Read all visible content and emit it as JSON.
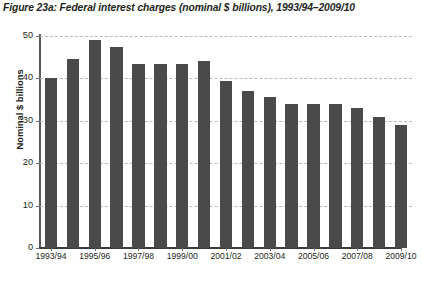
{
  "figure": {
    "title": "Figure 23a: Federal interest charges (nominal $ billions), 1993/94–2009/10",
    "bar_color": "#4a4a4a",
    "gridline_color": "#b9b9bb",
    "axis_color": "#58595b",
    "text_color": "#231f20",
    "background": "#ffffff"
  },
  "chart_data": {
    "type": "bar",
    "title": "Figure 23a: Federal interest charges (nominal $ billions), 1993/94–2009/10",
    "xlabel": "",
    "ylabel": "Nominal $ billions",
    "ylim": [
      0,
      50
    ],
    "yticks": [
      0,
      10,
      20,
      30,
      40,
      50
    ],
    "ytick_labels": [
      "0",
      "10",
      "20",
      "30",
      "40",
      "50"
    ],
    "grid": true,
    "grid_axis": "y",
    "legend": false,
    "categories": [
      "1993/94",
      "1994/95",
      "1995/96",
      "1996/97",
      "1997/98",
      "1998/99",
      "1999/00",
      "2000/01",
      "2001/02",
      "2002/03",
      "2003/04",
      "2004/05",
      "2005/06",
      "2006/07",
      "2007/08",
      "2008/09",
      "2009/10"
    ],
    "visible_tick_labels": [
      "1993/94",
      "1995/96",
      "1997/98",
      "1999/00",
      "2001/02",
      "2003/04",
      "2005/06",
      "2007/08",
      "2009/10"
    ],
    "visible_tick_indices": [
      0,
      2,
      4,
      6,
      8,
      10,
      12,
      14,
      16
    ],
    "values": [
      40.0,
      44.5,
      49.0,
      47.5,
      43.5,
      43.5,
      43.5,
      44.0,
      39.5,
      37.0,
      35.5,
      34.0,
      34.0,
      34.0,
      33.0,
      31.0,
      29.0
    ],
    "units": "nominal $ billions"
  }
}
